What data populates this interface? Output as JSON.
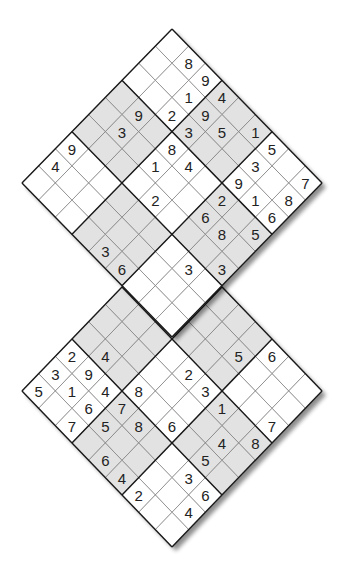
{
  "puzzle": {
    "type": "twin diamond sudoku",
    "colors": {
      "background": "#ffffff",
      "cell_white": "#ffffff",
      "cell_shaded": "#e2e2e2",
      "thin_line": "#7a7a7a",
      "box_line": "#1a1a1a",
      "digit": "#222222",
      "shadow": "#9a9a9a"
    },
    "shaded_boxes_rule": "checkerboard: 3x3 box (br,bc) shaded when (br+bc) is odd",
    "grids": [
      {
        "id": "top",
        "vertex_top": [
          172,
          29
        ],
        "cell_dx": 16.67,
        "cell_dy": 17.11,
        "givens": [
          {
            "r": 0,
            "c": 1,
            "v": "8"
          },
          {
            "r": 0,
            "c": 2,
            "v": "9"
          },
          {
            "r": 0,
            "c": 3,
            "v": "4"
          },
          {
            "r": 0,
            "c": 5,
            "v": "1"
          },
          {
            "r": 0,
            "c": 6,
            "v": "5"
          },
          {
            "r": 0,
            "c": 8,
            "v": "7"
          },
          {
            "r": 1,
            "c": 2,
            "v": "1"
          },
          {
            "r": 1,
            "c": 3,
            "v": "9"
          },
          {
            "r": 1,
            "c": 4,
            "v": "5"
          },
          {
            "r": 1,
            "c": 6,
            "v": "3"
          },
          {
            "r": 1,
            "c": 8,
            "v": "8"
          },
          {
            "r": 2,
            "c": 2,
            "v": "2"
          },
          {
            "r": 2,
            "c": 3,
            "v": "3"
          },
          {
            "r": 2,
            "c": 6,
            "v": "9"
          },
          {
            "r": 2,
            "c": 7,
            "v": "1"
          },
          {
            "r": 2,
            "c": 8,
            "v": "6"
          },
          {
            "r": 3,
            "c": 1,
            "v": "9"
          },
          {
            "r": 3,
            "c": 3,
            "v": "8"
          },
          {
            "r": 3,
            "c": 4,
            "v": "4"
          },
          {
            "r": 3,
            "c": 6,
            "v": "2"
          },
          {
            "r": 3,
            "c": 8,
            "v": "5"
          },
          {
            "r": 4,
            "c": 1,
            "v": "3"
          },
          {
            "r": 4,
            "c": 3,
            "v": "1"
          },
          {
            "r": 4,
            "c": 6,
            "v": "6"
          },
          {
            "r": 4,
            "c": 7,
            "v": "8"
          },
          {
            "r": 5,
            "c": 4,
            "v": "2"
          },
          {
            "r": 5,
            "c": 8,
            "v": "3"
          },
          {
            "r": 6,
            "c": 0,
            "v": "9"
          },
          {
            "r": 6,
            "c": 7,
            "v": "3"
          },
          {
            "r": 7,
            "c": 0,
            "v": "4"
          },
          {
            "r": 8,
            "c": 4,
            "v": "3"
          },
          {
            "r": 8,
            "c": 5,
            "v": "6"
          }
        ]
      },
      {
        "id": "bottom",
        "vertex_top": [
          172,
          235
        ],
        "cell_dx": 16.67,
        "cell_dy": 17.33,
        "givens": [
          {
            "r": 0,
            "c": 6,
            "v": "6"
          },
          {
            "r": 1,
            "c": 5,
            "v": "5"
          },
          {
            "r": 2,
            "c": 8,
            "v": "7"
          },
          {
            "r": 3,
            "c": 4,
            "v": "2"
          },
          {
            "r": 3,
            "c": 5,
            "v": "3"
          },
          {
            "r": 3,
            "c": 6,
            "v": "1"
          },
          {
            "r": 3,
            "c": 8,
            "v": "8"
          },
          {
            "r": 4,
            "c": 7,
            "v": "4"
          },
          {
            "r": 5,
            "c": 1,
            "v": "4"
          },
          {
            "r": 5,
            "c": 3,
            "v": "8"
          },
          {
            "r": 5,
            "c": 5,
            "v": "6"
          },
          {
            "r": 5,
            "c": 7,
            "v": "5"
          },
          {
            "r": 6,
            "c": 0,
            "v": "2"
          },
          {
            "r": 6,
            "c": 1,
            "v": "9"
          },
          {
            "r": 6,
            "c": 2,
            "v": "4"
          },
          {
            "r": 6,
            "c": 3,
            "v": "7"
          },
          {
            "r": 6,
            "c": 4,
            "v": "8"
          },
          {
            "r": 6,
            "c": 7,
            "v": "3"
          },
          {
            "r": 6,
            "c": 8,
            "v": "6"
          },
          {
            "r": 7,
            "c": 0,
            "v": "3"
          },
          {
            "r": 7,
            "c": 1,
            "v": "1"
          },
          {
            "r": 7,
            "c": 2,
            "v": "6"
          },
          {
            "r": 7,
            "c": 3,
            "v": "5"
          },
          {
            "r": 7,
            "c": 8,
            "v": "4"
          },
          {
            "r": 8,
            "c": 0,
            "v": "5"
          },
          {
            "r": 8,
            "c": 2,
            "v": "7"
          },
          {
            "r": 8,
            "c": 4,
            "v": "6"
          },
          {
            "r": 8,
            "c": 5,
            "v": "4"
          },
          {
            "r": 8,
            "c": 6,
            "v": "2"
          }
        ]
      }
    ]
  }
}
